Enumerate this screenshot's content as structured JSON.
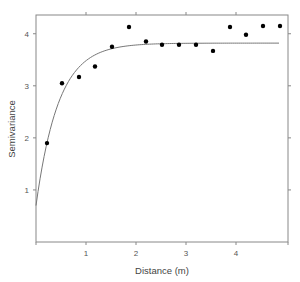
{
  "chart_data": {
    "type": "scatter",
    "title": "",
    "xlabel": "Distance (m)",
    "ylabel": "Semivariance",
    "xlim": [
      0,
      5.04
    ],
    "ylim": [
      0,
      4.36
    ],
    "xticks": [
      1,
      2,
      3,
      4
    ],
    "yticks": [
      1,
      2,
      3,
      4
    ],
    "grid": false,
    "legend": null,
    "series": [
      {
        "name": "Empirical semivariance",
        "kind": "points",
        "x": [
          0.22,
          0.52,
          0.86,
          1.18,
          1.52,
          1.86,
          2.2,
          2.52,
          2.86,
          3.2,
          3.54,
          3.88,
          4.2,
          4.54,
          4.88
        ],
        "y": [
          1.9,
          3.05,
          3.17,
          3.37,
          3.75,
          4.13,
          3.85,
          3.79,
          3.79,
          3.79,
          3.67,
          4.13,
          3.98,
          4.15,
          4.15
        ]
      },
      {
        "name": "Fitted exponential model",
        "kind": "line",
        "model": "exponential",
        "nugget": 0.7,
        "sill": 3.82,
        "range_param": 0.45,
        "x_max": 4.86
      }
    ]
  }
}
